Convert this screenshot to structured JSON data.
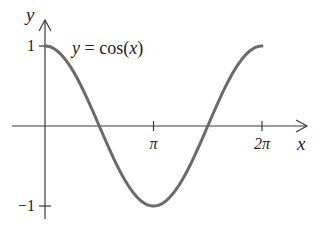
{
  "chart_data": {
    "type": "line",
    "title": "y = cos(x)",
    "xlabel": "x",
    "ylabel": "y",
    "xlim": [
      0,
      6.283185307
    ],
    "ylim": [
      -1,
      1
    ],
    "grid": false,
    "legend": "none",
    "x_ticks": [
      {
        "value": 3.141592654,
        "label": "π"
      },
      {
        "value": 6.283185307,
        "label": "2π"
      }
    ],
    "y_ticks": [
      {
        "value": 1,
        "label": "1"
      },
      {
        "value": -1,
        "label": "−1"
      }
    ],
    "series": [
      {
        "name": "cos(x)",
        "function": "cos",
        "domain": [
          0,
          6.283185307
        ],
        "color": "#6a6a6a",
        "x": [
          0,
          0.785398,
          1.570796,
          2.356194,
          3.141593,
          3.926991,
          4.712389,
          5.497787,
          6.283185
        ],
        "y": [
          1,
          0.7071,
          0,
          -0.7071,
          -1,
          -0.7071,
          0,
          0.7071,
          1
        ]
      }
    ],
    "annotations": [
      {
        "text_parts": [
          "y",
          " = cos(",
          "x",
          ")"
        ],
        "near": "top-center"
      }
    ]
  }
}
